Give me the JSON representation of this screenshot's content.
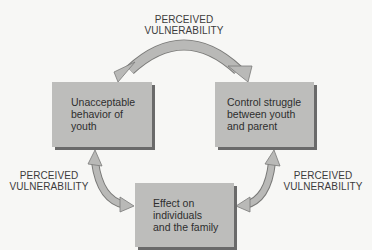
{
  "diagram": {
    "type": "cycle",
    "nodes": [
      {
        "id": "unacceptable",
        "lines": [
          "Unacceptable",
          "behavior of",
          "youth"
        ]
      },
      {
        "id": "control",
        "lines": [
          "Control struggle",
          "between youth",
          "and parent"
        ]
      },
      {
        "id": "effect",
        "lines": [
          "Effect on",
          "individuals",
          "and the family"
        ]
      }
    ],
    "edges": [
      {
        "from": "unacceptable",
        "to": "control",
        "label": [
          "PERCEIVED",
          "VULNERABILITY"
        ]
      },
      {
        "from": "control",
        "to": "effect",
        "label": [
          "PERCEIVED",
          "VULNERABILITY"
        ]
      },
      {
        "from": "effect",
        "to": "unacceptable",
        "label": [
          "PERCEIVED",
          "VULNERABILITY"
        ]
      }
    ]
  },
  "colors": {
    "box_fill": "#bdbdbb",
    "box_shadow": "#6a6a6a",
    "arrow_fill": "#b9b9b7",
    "arrow_edge": "#7a7a78",
    "background": "#f7f7f5"
  }
}
